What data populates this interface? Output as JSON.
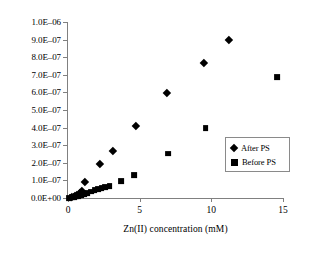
{
  "chart_data": {
    "type": "scatter",
    "title": "",
    "xlabel": "Zn(II) concentration (mM)",
    "ylabel": "Peak current (A)",
    "xlim": [
      0,
      15
    ],
    "ylim": [
      0,
      1e-06
    ],
    "xticks": [
      0,
      5,
      10,
      15
    ],
    "xticklabels": [
      "0",
      "5",
      "10",
      "15"
    ],
    "yticks": [
      0,
      1e-07,
      2e-07,
      3e-07,
      4e-07,
      5e-07,
      6e-07,
      7e-07,
      8e-07,
      9e-07,
      1e-06
    ],
    "yticklabels": [
      "0.0E+00",
      "1.0E–07",
      "2.0E–07",
      "3.0E–07",
      "4.0E–07",
      "5.0E–07",
      "6.0E–07",
      "7.0E–07",
      "8.0E–07",
      "9.0E–07",
      "1.0E–06"
    ],
    "grid": false,
    "legend_position": "center-right",
    "series": [
      {
        "name": "After PS",
        "marker": "diamond",
        "color": "#000000",
        "marker_size": 7,
        "points": [
          [
            0.1,
            1e-09
          ],
          [
            0.3,
            6e-09
          ],
          [
            0.45,
            1.2e-08
          ],
          [
            0.6,
            2e-08
          ],
          [
            0.75,
            3.4e-08
          ],
          [
            1.0,
            8.8e-08
          ],
          [
            2.0,
            1.88e-07
          ],
          [
            2.9,
            2.63e-07
          ],
          [
            4.5,
            4.02e-07
          ],
          [
            6.7,
            5.9e-07
          ],
          [
            9.3,
            7.62e-07
          ],
          [
            11.0,
            8.92e-07
          ]
        ]
      },
      {
        "name": "Before PS",
        "marker": "square",
        "color": "#000000",
        "marker_size": 7,
        "points": [
          [
            0.1,
            1e-09
          ],
          [
            0.25,
            3e-09
          ],
          [
            0.4,
            6e-09
          ],
          [
            0.55,
            9e-09
          ],
          [
            0.7,
            1.3e-08
          ],
          [
            0.9,
            1.8e-08
          ],
          [
            1.1,
            2.4e-08
          ],
          [
            1.35,
            3e-08
          ],
          [
            1.6,
            3.6e-08
          ],
          [
            1.85,
            4.3e-08
          ],
          [
            2.1,
            4.9e-08
          ],
          [
            2.35,
            5.4e-08
          ],
          [
            2.6,
            6e-08
          ],
          [
            2.9,
            6.6e-08
          ],
          [
            3.7,
            9.5e-08
          ],
          [
            4.6,
            1.28e-07
          ],
          [
            7.0,
            2.52e-07
          ],
          [
            9.6,
            3.97e-07
          ],
          [
            14.6,
            6.85e-07
          ]
        ]
      }
    ],
    "legend": [
      {
        "label": "After PS",
        "marker": "diamond"
      },
      {
        "label": "Before PS",
        "marker": "square"
      }
    ]
  }
}
